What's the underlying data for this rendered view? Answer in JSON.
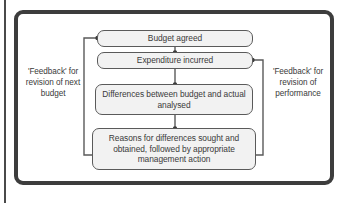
{
  "diagram": {
    "type": "flowchart",
    "frame_color": "#3d3d3d",
    "node_fill": "#f2f2f2",
    "node_border": "#5a5a5a",
    "connector_color": "#5a5a5a",
    "nodes": [
      {
        "id": "budget-agreed",
        "label": "Budget agreed"
      },
      {
        "id": "expenditure-incurred",
        "label": "Expenditure incurred"
      },
      {
        "id": "differences",
        "label": "Differences between budget and actual analysed"
      },
      {
        "id": "reasons",
        "label": "Reasons for differences sought and obtained, followed by appropriate management action"
      }
    ],
    "labels": {
      "left_feedback": "'Feedback' for revision of next budget",
      "right_feedback": "'Feedback' for revision of performance"
    },
    "connectors": [
      {
        "from": "budget-agreed",
        "to": "expenditure-incurred",
        "style": "line-with-dot"
      },
      {
        "from": "expenditure-incurred",
        "to": "differences",
        "style": "line-with-dot"
      },
      {
        "from": "differences",
        "to": "reasons",
        "style": "line-with-dot"
      },
      {
        "from": "reasons",
        "to": "budget-agreed",
        "style": "left-feedback-loop"
      },
      {
        "from": "reasons",
        "to": "expenditure-incurred",
        "style": "right-feedback-loop"
      }
    ]
  }
}
